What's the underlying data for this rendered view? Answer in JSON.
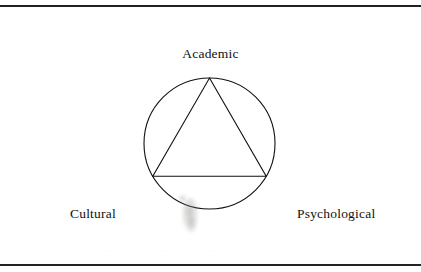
{
  "figure": {
    "type": "triangle-in-circle-diagram",
    "labels": {
      "top": "Academic",
      "bottom_left": "Cultural",
      "bottom_right": "Psychological"
    },
    "geometry": {
      "circle": {
        "cx": 209.5,
        "cy": 143.5,
        "r": 65.5
      },
      "triangle": {
        "apex": {
          "x": 209.5,
          "y": 78.0
        },
        "bottom_left": {
          "x": 152.8,
          "y": 176.2
        },
        "bottom_right": {
          "x": 266.2,
          "y": 176.2
        }
      },
      "stroke_color": "#111111",
      "stroke_width": 1.1,
      "fill": "none"
    }
  },
  "rules": {
    "top_rule": "",
    "bottom_rule": ""
  },
  "artifacts": {
    "ghost_top_left": "··· ·· ···· ·· ···",
    "ghost_top_right": "···· ·· ···",
    "ghost_bottom": "··· ·· ··· ····· ···· ·· ·······"
  },
  "colors": {
    "page_background": "#ffffff",
    "ink": "#111111",
    "stain": "#8a8682"
  }
}
